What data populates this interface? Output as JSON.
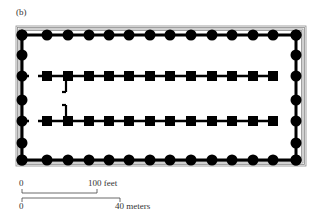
{
  "figure": {
    "panel_label": "(b)"
  },
  "plan": {
    "frame": {
      "x": 16,
      "y": 26,
      "w": 290,
      "h": 140,
      "rings": 4,
      "ring_color": "#8a8a8a"
    },
    "colonnade_rect": {
      "x1": 22,
      "y1": 35,
      "x2": 296,
      "y2": 160
    },
    "front_back_columns_x": [
      22,
      47,
      68,
      89,
      109,
      129,
      150,
      170,
      191,
      212,
      232,
      253,
      273,
      296
    ],
    "side_columns_y": [
      35,
      55,
      76,
      100,
      121,
      143,
      160
    ],
    "interior_rows_y": [
      76,
      121
    ],
    "interior_piers_x": [
      47,
      68,
      89,
      109,
      129,
      150,
      170,
      191,
      212,
      232,
      253,
      273
    ],
    "doorway_marks": [
      {
        "x": 66,
        "y1": 80,
        "y2": 92
      },
      {
        "x": 66,
        "y1": 105,
        "y2": 117
      }
    ],
    "fill_color": "#000000"
  },
  "scale": {
    "feet": {
      "zero_label": "0",
      "end_label": "100 feet",
      "x0": 22,
      "x1": 97,
      "y": 193
    },
    "meters": {
      "zero_label": "0",
      "end_label": "40 meters",
      "x0": 22,
      "x1": 120,
      "y": 198
    }
  }
}
